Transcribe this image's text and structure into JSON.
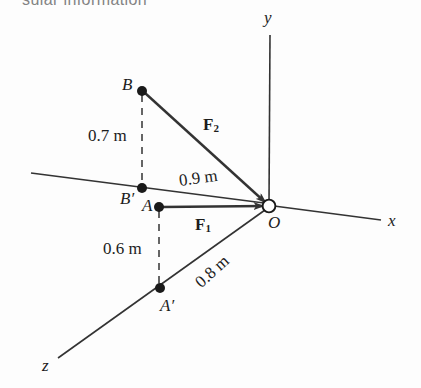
{
  "figure": {
    "title_fragment": "sular information",
    "background_color": "#fdfdfd",
    "line_color": "#333333",
    "text_color": "#1c1c1c",
    "axes": [
      {
        "name": "y-axis",
        "label": "y"
      },
      {
        "name": "x-axis",
        "label": "x"
      },
      {
        "name": "z-axis",
        "label": "z"
      }
    ],
    "points": [
      {
        "name": "point-b",
        "label": "B",
        "marker": "filled-dot"
      },
      {
        "name": "point-b-prime",
        "label": "B′",
        "marker": "filled-dot"
      },
      {
        "name": "point-a",
        "label": "A",
        "marker": "filled-dot"
      },
      {
        "name": "point-a-prime",
        "label": "A′",
        "marker": "filled-dot"
      },
      {
        "name": "point-o",
        "label": "O",
        "marker": "open-circle"
      }
    ],
    "dimensions": [
      {
        "name": "dim-0-7",
        "label": "0.7 m",
        "value": 0.7,
        "unit": "m",
        "from": "B",
        "to": "B′"
      },
      {
        "name": "dim-0-9",
        "label": "0.9 m",
        "value": 0.9,
        "unit": "m",
        "from": "B′",
        "to": "O"
      },
      {
        "name": "dim-0-6",
        "label": "0.6 m",
        "value": 0.6,
        "unit": "m",
        "from": "A",
        "to": "A′"
      },
      {
        "name": "dim-0-8",
        "label": "0.8 m",
        "value": 0.8,
        "unit": "m",
        "from": "A′",
        "to": "O"
      }
    ],
    "forces": [
      {
        "name": "force-f1",
        "base": "F",
        "sub": "1",
        "from": "A",
        "to": "O"
      },
      {
        "name": "force-f2",
        "base": "F",
        "sub": "2",
        "from": "B",
        "to": "O"
      }
    ]
  }
}
